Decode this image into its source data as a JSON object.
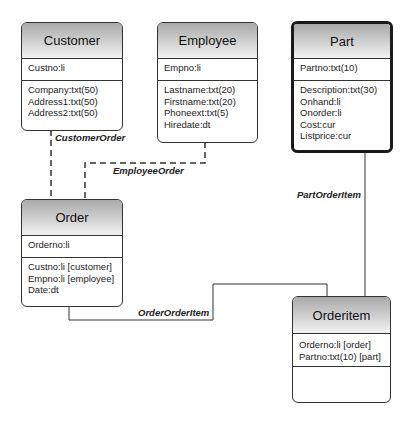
{
  "entities": {
    "customer": {
      "name": "Customer",
      "key": [
        "Custno:li"
      ],
      "attributes": [
        "Company:txt(50)",
        "Address1:txt(50)",
        "Address2:txt(50)"
      ]
    },
    "employee": {
      "name": "Employee",
      "key": [
        "Empno:li"
      ],
      "attributes": [
        "Lastname:txt(20)",
        "Firstname:txt(20)",
        "Phoneext:txt(5)",
        "Hiredate:dt"
      ]
    },
    "part": {
      "name": "Part",
      "key": [
        "Partno:txt(10)"
      ],
      "attributes": [
        "Description:txt(30)",
        "Onhand:li",
        "Onorder:li",
        "Cost:cur",
        "Listprice:cur"
      ]
    },
    "order": {
      "name": "Order",
      "key": [
        "Orderno:li"
      ],
      "attributes": [
        "Custno:li [customer]",
        "Empno:li [employee]",
        "Date:dt"
      ]
    },
    "orderitem": {
      "name": "Orderitem",
      "key": [
        "Orderno:li [order]",
        "Partno:txt(10) [part]"
      ],
      "attributes": []
    }
  },
  "relationships": {
    "customer_order": {
      "label": "CustomerOrder",
      "from": "Customer",
      "to": "Order",
      "style": "dashed"
    },
    "employee_order": {
      "label": "EmployeeOrder",
      "from": "Employee",
      "to": "Order",
      "style": "dashed"
    },
    "part_orderitem": {
      "label": "PartOrderItem",
      "from": "Part",
      "to": "Orderitem",
      "style": "solid"
    },
    "order_orderitem": {
      "label": "OrderOrderItem",
      "from": "Order",
      "to": "Orderitem",
      "style": "solid"
    }
  }
}
